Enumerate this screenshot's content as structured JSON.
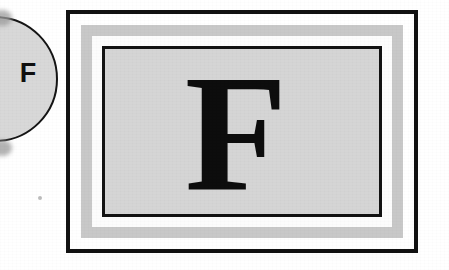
{
  "page": {
    "background_color": "#ffffff",
    "width": 449,
    "height": 270
  },
  "index_tab": {
    "letter": "F",
    "shape": "circle",
    "fill_color": "#d8d8d8",
    "stroke_color": "#151515",
    "clipped": "left edge"
  },
  "plate": {
    "letter": "F",
    "letter_style": "bold serif",
    "outer_border_color": "#121212",
    "mat_gray_color": "#c8c8c8",
    "mat_white_color": "#fcfcfc",
    "inner_border_color": "#121212",
    "field_color": "#d5d5d5"
  }
}
